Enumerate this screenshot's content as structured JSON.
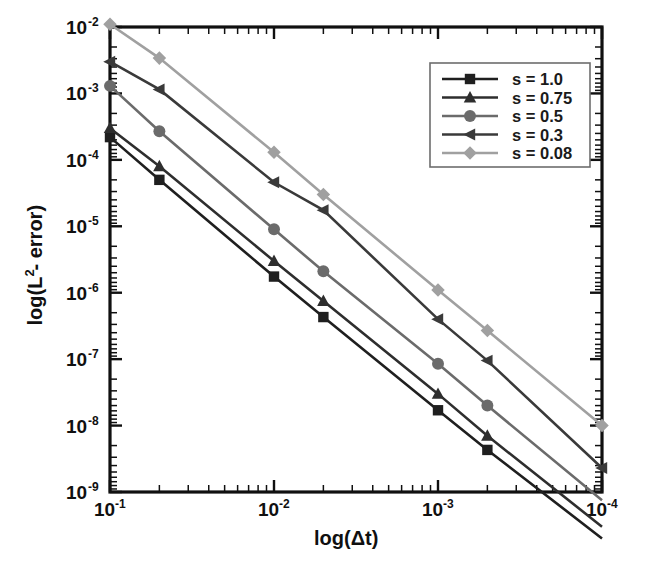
{
  "chart_data": {
    "type": "line",
    "title": "",
    "xlabel": "log(Δt)",
    "ylabel": "log(L² - error)",
    "xscale": "log",
    "yscale": "log",
    "x_reversed": true,
    "xlim": [
      0.1,
      0.0001
    ],
    "ylim": [
      1e-09,
      0.01
    ],
    "grid": false,
    "legend_position": "upper right",
    "x_tick_labels": [
      "10-1",
      "10-2",
      "10-3",
      "10-4"
    ],
    "x_tick_bases": [
      "10",
      "10",
      "10",
      "10"
    ],
    "x_tick_exponents": [
      "-1",
      "-2",
      "-3",
      "-4"
    ],
    "x_tick_values": [
      0.1,
      0.01,
      0.001,
      0.0001
    ],
    "y_tick_bases": [
      "10",
      "10",
      "10",
      "10",
      "10",
      "10",
      "10",
      "10"
    ],
    "y_tick_exponents": [
      "-2",
      "-3",
      "-4",
      "-5",
      "-6",
      "-7",
      "-8",
      "-9"
    ],
    "y_tick_values": [
      0.01,
      0.001,
      0.0001,
      1e-05,
      1e-06,
      1e-07,
      1e-08,
      1e-09
    ],
    "x": [
      0.1,
      0.05,
      0.01,
      0.005,
      0.001,
      0.0005,
      0.0001
    ],
    "series": [
      {
        "name": "s = 1.0",
        "label": "s = 1.0",
        "marker": "square",
        "color": "#1f1f1f",
        "values": [
          0.00022,
          5e-05,
          1.75e-06,
          4.3e-07,
          1.7e-08,
          4.3e-09,
          2e-10
        ]
      },
      {
        "name": "s = 0.75",
        "label": "s = 0.75",
        "marker": "triangle",
        "color": "#2e2e2e",
        "values": [
          0.0003,
          8e-05,
          3e-06,
          7.5e-07,
          3e-08,
          7e-09,
          3e-10
        ]
      },
      {
        "name": "s = 0.5",
        "label": "s = 0.5",
        "marker": "circle",
        "color": "#6b6b6b",
        "values": [
          0.0013,
          0.00027,
          9e-06,
          2.1e-06,
          8.5e-08,
          2e-08,
          7.5e-10
        ]
      },
      {
        "name": "s = 0.3",
        "label": "s = 0.3",
        "marker": "triangle-left",
        "color": "#3a3a3a",
        "values": [
          0.003,
          0.00115,
          4.6e-05,
          1.75e-05,
          4e-07,
          9.5e-08,
          2.3e-09
        ]
      },
      {
        "name": "s = 0.08",
        "label": "s = 0.08",
        "marker": "diamond",
        "color": "#a0a0a0",
        "values": [
          0.011,
          0.0034,
          0.00013,
          3e-05,
          1.1e-06,
          2.7e-07,
          1e-08
        ]
      }
    ]
  },
  "axes": {
    "x_label_text": "log(",
    "x_label_var": "Δt",
    "x_label_close": ")",
    "y_label_pre": "log(L",
    "y_label_sup": "2",
    "y_label_post": " - error)"
  }
}
